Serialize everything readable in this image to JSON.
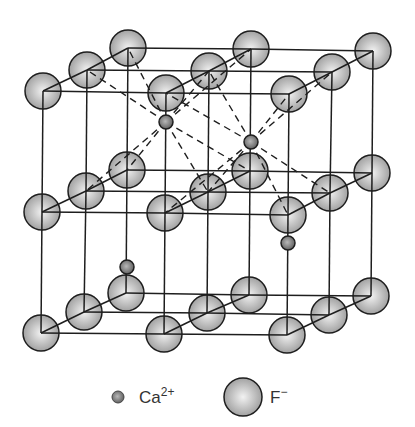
{
  "figure": {
    "colors": {
      "line": "#1e1e1e",
      "fluoride_fill_center": "#f2f2f2",
      "fluoride_fill_edge": "#9a9a9a",
      "calcium_fill_center": "#b8b8b8",
      "calcium_fill_edge": "#5a5a5a",
      "background": "#ffffff"
    },
    "fluoride_radius": 18,
    "calcium_radius": 7,
    "layers": [
      {
        "name": "top",
        "rows": [
          [
            [
              128,
              48
            ],
            [
              251,
              49
            ],
            [
              373,
              51
            ]
          ],
          [
            [
              87,
              70
            ],
            [
              209,
              71
            ],
            [
              332,
              72
            ]
          ],
          [
            [
              43,
              91
            ],
            [
              166,
              93
            ],
            [
              289,
              94
            ]
          ]
        ]
      },
      {
        "name": "middle",
        "rows": [
          [
            [
              127,
              170
            ],
            [
              250,
              171
            ],
            [
              372,
              173
            ]
          ],
          [
            [
              86,
              191
            ],
            [
              208,
              192
            ],
            [
              330,
              193
            ]
          ],
          [
            [
              42,
              212
            ],
            [
              165,
              213
            ],
            [
              288,
              215
            ]
          ]
        ]
      },
      {
        "name": "bottom",
        "rows": [
          [
            [
              126,
              293
            ],
            [
              249,
              295
            ],
            [
              371,
              296
            ]
          ],
          [
            [
              84,
              312
            ],
            [
              207,
              313
            ],
            [
              329,
              315
            ]
          ],
          [
            [
              41,
              333
            ],
            [
              164,
              334
            ],
            [
              287,
              335
            ]
          ]
        ]
      }
    ],
    "calcium_ions": [
      {
        "id": "ca1",
        "x": 166,
        "y": 122,
        "dashed_to": [
          [
            87,
            70
          ],
          [
            128,
            48
          ],
          [
            209,
            71
          ],
          [
            251,
            49
          ],
          [
            86,
            191
          ],
          [
            127,
            170
          ],
          [
            208,
            192
          ],
          [
            250,
            171
          ]
        ]
      },
      {
        "id": "ca2",
        "x": 251,
        "y": 142,
        "dashed_to": [
          [
            209,
            71
          ],
          [
            166,
            93
          ],
          [
            289,
            94
          ],
          [
            332,
            72
          ],
          [
            208,
            192
          ],
          [
            165,
            213
          ],
          [
            288,
            215
          ],
          [
            330,
            193
          ]
        ]
      },
      {
        "id": "ca3",
        "x": 127,
        "y": 267,
        "dashed_to": []
      },
      {
        "id": "ca4",
        "x": 288,
        "y": 243,
        "dashed_to": []
      }
    ]
  },
  "legend": {
    "calcium": {
      "symbol": "Ca",
      "charge": "2+",
      "x": 118,
      "y": 397
    },
    "fluoride": {
      "symbol": "F",
      "charge": "−",
      "x": 243,
      "y": 397
    }
  }
}
